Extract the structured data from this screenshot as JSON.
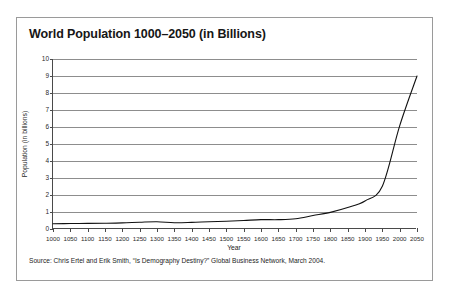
{
  "figure": {
    "title": "World Population 1000–2050 (in Billions)",
    "source_note": "Source: Chris Ertel and Erik Smith, “Is Demography Destiny?” Global Business Network, March 2004.",
    "page_artifact": "",
    "frame_color": "#9a9a9a",
    "axis_color": "#4a4a4a",
    "grid_color": "#8d8d8d",
    "curve_color": "#111111"
  },
  "chart_data": {
    "type": "line",
    "title": "World Population 1000–2050 (in Billions)",
    "xlabel": "Year",
    "ylabel": "Population (in billions)",
    "xlim": [
      1000,
      2050
    ],
    "ylim": [
      0,
      10
    ],
    "grid": true,
    "legend": "none",
    "ytick_labels": [
      "0",
      "1",
      "2",
      "3",
      "4",
      "5",
      "6",
      "7",
      "8",
      "9",
      "10"
    ],
    "yticks": [
      0,
      1,
      2,
      3,
      4,
      5,
      6,
      7,
      8,
      9,
      10
    ],
    "xtick_labels": [
      "1000",
      "1050",
      "1100",
      "1150",
      "1200",
      "1250",
      "1300",
      "1350",
      "1400",
      "1450",
      "1500",
      "1550",
      "1600",
      "1650",
      "1700",
      "1750",
      "1800",
      "1850",
      "1900",
      "1950",
      "2000",
      "2050"
    ],
    "xticks": [
      1000,
      1050,
      1100,
      1150,
      1200,
      1250,
      1300,
      1350,
      1400,
      1450,
      1500,
      1550,
      1600,
      1650,
      1700,
      1750,
      1800,
      1850,
      1900,
      1950,
      2000,
      2050
    ],
    "series": [
      {
        "name": "World population",
        "x": [
          1000,
          1050,
          1100,
          1150,
          1200,
          1250,
          1300,
          1350,
          1400,
          1450,
          1500,
          1550,
          1600,
          1650,
          1700,
          1750,
          1800,
          1850,
          1900,
          1950,
          2000,
          2050
        ],
        "values": [
          0.31,
          0.32,
          0.33,
          0.34,
          0.36,
          0.4,
          0.43,
          0.37,
          0.39,
          0.43,
          0.46,
          0.5,
          0.55,
          0.55,
          0.6,
          0.79,
          0.98,
          1.26,
          1.65,
          2.52,
          6.07,
          9.0
        ]
      }
    ]
  }
}
